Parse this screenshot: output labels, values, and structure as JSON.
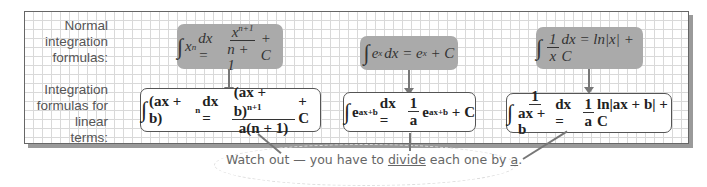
{
  "labels": {
    "normal": [
      "Normal",
      "integration",
      "formulas:"
    ],
    "linear": [
      "Integration",
      "formulas for",
      "linear terms:"
    ]
  },
  "normal_formulas": [
    {
      "lhs": "x",
      "lhs_sup": "n",
      "lhs_tail": "dx =",
      "num": "x",
      "num_sup": "n+1",
      "den": "n + 1",
      "rhs": "+ C"
    },
    {
      "lhs": "e",
      "lhs_sup": "x",
      "lhs_tail": "dx = e",
      "rhs_sup": "x",
      "rhs": " + C"
    },
    {
      "num": "1",
      "den": "x",
      "lhs_tail": "dx = ln|x| + C"
    }
  ],
  "linear_formulas": [
    {
      "lhs": "(ax + b)",
      "lhs_sup": "n",
      "lhs_tail": "dx =",
      "num": "(ax + b)",
      "num_sup": "n+1",
      "den": "a(n + 1)",
      "rhs": "+ C"
    },
    {
      "lhs": "e",
      "lhs_sup": "ax+b",
      "lhs_tail": "dx =",
      "num": "1",
      "den": "a",
      "rhs_main": "e",
      "rhs_sup": "ax+b",
      "rhs": " + C"
    },
    {
      "num": "1",
      "den": "ax + b",
      "mid": "dx =",
      "num2": "1",
      "den2": "a",
      "rhs": "ln|ax + b| + C"
    }
  ],
  "note": {
    "pre": "Watch out — you have to ",
    "emph": "divide",
    "mid": " each one by ",
    "var": "a",
    "post": "."
  },
  "colors": {
    "gray_box": "#aaaaaa",
    "grid": "#d9d9d9",
    "border": "#555555"
  }
}
